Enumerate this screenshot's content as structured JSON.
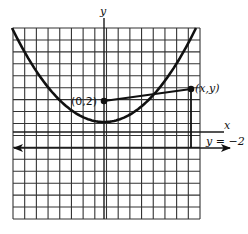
{
  "figure": {
    "type": "parabola-focus-directrix diagram",
    "axes": {
      "x_label": "x",
      "y_label": "y"
    },
    "grid": {
      "columns": 16,
      "rows": 16,
      "left": 13,
      "top": 28,
      "right": 200,
      "bottom": 219
    },
    "focus": {
      "label": "(0,2)",
      "px": [
        104,
        101
      ]
    },
    "point_on_curve": {
      "label": "(x,y)",
      "px": [
        191,
        89
      ]
    },
    "vertex_px": [
      104,
      122
    ],
    "directrix": {
      "label": "y = −2",
      "y_px": 148
    },
    "colors": {
      "ink": "#111111",
      "grid": "#333333",
      "background": "#ffffff"
    }
  }
}
